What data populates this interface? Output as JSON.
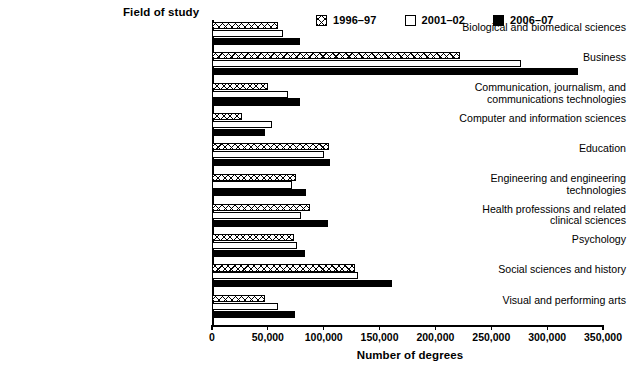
{
  "chart_data": {
    "type": "bar",
    "orientation": "horizontal",
    "title": "",
    "ylabel": "Field of study",
    "xlabel": "Number of degrees",
    "xlim": [
      0,
      350000
    ],
    "xticks": [
      "0",
      "50,000",
      "100,000",
      "150,000",
      "200,000",
      "250,000",
      "300,000",
      "350,000"
    ],
    "xtick_values": [
      0,
      50000,
      100000,
      150000,
      200000,
      250000,
      300000,
      350000
    ],
    "grid": false,
    "legend_position": "top-right",
    "categories": [
      "Biological and biomedical sciences",
      "Business",
      "Communication, journalism, and\ncommunications technologies",
      "Computer and information sciences",
      "Education",
      "Engineering and engineering\ntechnologies",
      "Health professions and related\nclinical sciences",
      "Psychology",
      "Social sciences and history",
      "Visual and performing arts"
    ],
    "series": [
      {
        "name": "1996–97",
        "style": "crosshatch",
        "values": [
          59000,
          222000,
          50000,
          27000,
          105000,
          75000,
          88000,
          73000,
          128000,
          47000
        ]
      },
      {
        "name": "2001–02",
        "style": "white",
        "values": [
          64000,
          277000,
          68000,
          54000,
          100000,
          72000,
          80000,
          76000,
          131000,
          59000
        ]
      },
      {
        "name": "2006–07",
        "style": "black",
        "values": [
          79000,
          328000,
          79000,
          47000,
          106000,
          84000,
          104000,
          83000,
          161000,
          74000
        ]
      }
    ]
  }
}
